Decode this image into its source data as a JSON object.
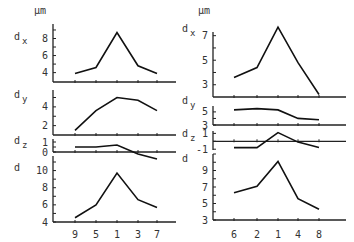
{
  "unit_label": "µm",
  "chart_data": [
    {
      "type": "line",
      "name": "left-figure",
      "categories": [
        "9",
        "5",
        "1",
        "3",
        "7"
      ],
      "unit": "µm",
      "panels": [
        {
          "label": "dx",
          "label_main": "d",
          "label_sub": "x",
          "yticks": [
            4,
            6,
            8
          ],
          "ylim": [
            2.9,
            9.7
          ],
          "values": [
            3.9,
            4.6,
            8.7,
            4.8,
            3.9
          ]
        },
        {
          "label": "dy",
          "label_main": "d",
          "label_sub": "y",
          "yticks": [
            2,
            4
          ],
          "ylim": [
            1.0,
            5.8
          ],
          "values": [
            1.5,
            3.6,
            5.0,
            4.7,
            3.6
          ]
        },
        {
          "label": "dz",
          "label_main": "d",
          "label_sub": "z",
          "yticks": [
            0,
            1
          ],
          "ylim": [
            0,
            1.3
          ],
          "zero_line": true,
          "values": [
            0.5,
            0.5,
            0.7,
            -0.2,
            -0.7
          ]
        },
        {
          "label": "d",
          "label_main": "d",
          "label_sub": "",
          "yticks": [
            4,
            6,
            8,
            10
          ],
          "ylim": [
            4,
            11.7
          ],
          "values": [
            4.5,
            6.0,
            9.7,
            6.6,
            5.7
          ]
        }
      ]
    },
    {
      "type": "line",
      "name": "right-figure",
      "categories": [
        "6",
        "2",
        "1",
        "4",
        "8"
      ],
      "unit": "µm",
      "panels": [
        {
          "label": "dx",
          "label_main": "d",
          "label_sub": "x",
          "yticks": [
            3,
            5,
            7
          ],
          "ylim": [
            2.0,
            7.3
          ],
          "values": [
            3.6,
            4.4,
            7.7,
            4.8,
            2.2
          ]
        },
        {
          "label": "dy",
          "label_main": "d",
          "label_sub": "y",
          "yticks": [
            3,
            5
          ],
          "ylim": [
            3.0,
            5.9
          ],
          "values": [
            5.3,
            5.5,
            5.3,
            4.0,
            3.8
          ]
        },
        {
          "label": "dz",
          "label_main": "d",
          "label_sub": "z",
          "yticks": [
            -1,
            1
          ],
          "ylim": [
            -1.1,
            1.3
          ],
          "zero_line": true,
          "values": [
            -0.8,
            -0.8,
            1.1,
            -0.1,
            -0.8
          ]
        },
        {
          "label": "d",
          "label_main": "d",
          "label_sub": "",
          "yticks": [
            3,
            5,
            7,
            9
          ],
          "ylim": [
            3.0,
            11.0
          ],
          "values": [
            6.3,
            7.1,
            10.1,
            5.6,
            4.3
          ]
        }
      ]
    }
  ]
}
